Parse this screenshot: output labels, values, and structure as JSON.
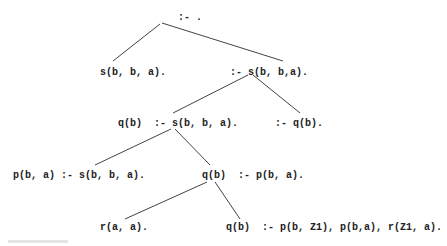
{
  "diagram": {
    "type": "proof-tree",
    "nodes": [
      {
        "id": "n0",
        "label": ":- .",
        "x": 178,
        "y": 12
      },
      {
        "id": "n1",
        "label": "s(b, b, a).",
        "x": 100,
        "y": 67
      },
      {
        "id": "n2",
        "label": ":- s(b, b,a).",
        "x": 230,
        "y": 67
      },
      {
        "id": "n3",
        "label": "q(b)  :- s(b, b, a).",
        "x": 118,
        "y": 118
      },
      {
        "id": "n4",
        "label": ":- q(b).",
        "x": 275,
        "y": 118
      },
      {
        "id": "n5",
        "label": "p(b, a) :- s(b, b, a).",
        "x": 13,
        "y": 170
      },
      {
        "id": "n6",
        "label": "q(b)  :- p(b, a).",
        "x": 202,
        "y": 170
      },
      {
        "id": "n7",
        "label": "r(a, a).",
        "x": 100,
        "y": 222
      },
      {
        "id": "n8",
        "label": "q(b)  :- p(b, Z1), p(b,a), r(Z1, a).",
        "x": 226,
        "y": 222
      }
    ],
    "edges": [
      {
        "from": "n0",
        "to": "n1",
        "x1": 160,
        "y1": 24,
        "x2": 113,
        "y2": 61
      },
      {
        "from": "n0",
        "to": "n2",
        "x1": 162,
        "y1": 23,
        "x2": 283,
        "y2": 61
      },
      {
        "from": "n2",
        "to": "n3",
        "x1": 248,
        "y1": 75,
        "x2": 173,
        "y2": 113
      },
      {
        "from": "n2",
        "to": "n4",
        "x1": 253,
        "y1": 75,
        "x2": 300,
        "y2": 113
      },
      {
        "from": "n3",
        "to": "n5",
        "x1": 171,
        "y1": 129,
        "x2": 95,
        "y2": 165
      },
      {
        "from": "n3",
        "to": "n6",
        "x1": 175,
        "y1": 129,
        "x2": 210,
        "y2": 165
      },
      {
        "from": "n6",
        "to": "n7",
        "x1": 207,
        "y1": 182,
        "x2": 125,
        "y2": 219
      },
      {
        "from": "n6",
        "to": "n8",
        "x1": 215,
        "y1": 182,
        "x2": 240,
        "y2": 219
      }
    ],
    "line_color": "#444444"
  }
}
